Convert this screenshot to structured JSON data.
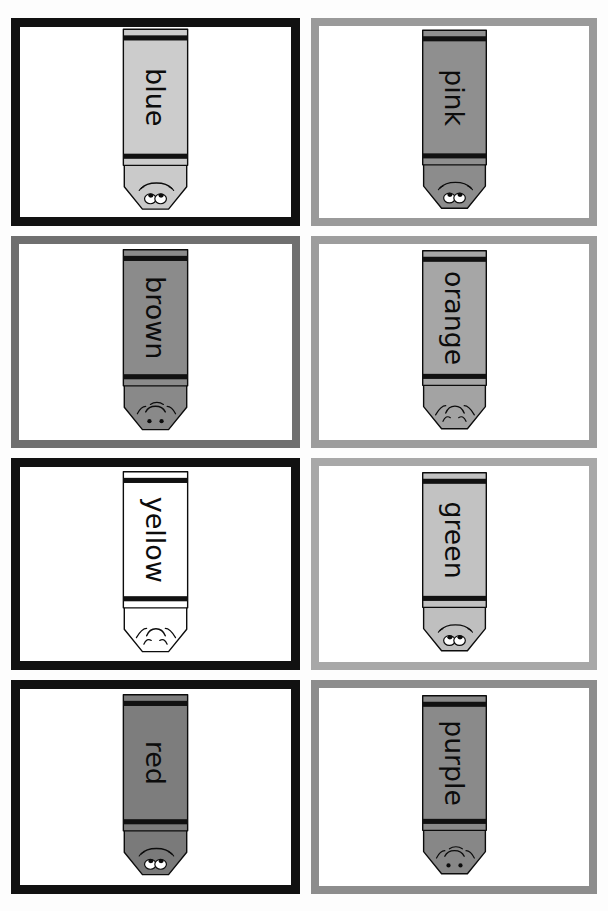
{
  "document": {
    "title": "Crayon Color Word Flashcards",
    "header_fragment_left": "y   g",
    "header_fragment_mid": "pp",
    "header_fragment_right": "g",
    "page_width": 608,
    "page_height": 911,
    "columns": 2,
    "rows": 4,
    "is_grayscale": true
  },
  "palette": {
    "ink_black": "#0c0c0c",
    "card_border": "#111111",
    "card_border_soft": "#8f8f8f",
    "card_face": "#ffffff",
    "page_bg": "#fdfdfd",
    "band_black": "#111111",
    "outline": "#0c0c0c"
  },
  "cards": [
    {
      "id": "card-blue",
      "label": "blue",
      "column": 1,
      "row": 1,
      "crayon_fill": "#cccccc",
      "crayon_tip_fill": "#cacaca",
      "border_color": "#111111",
      "border_style": "black",
      "face": "open-eyes",
      "x": 11,
      "y": 18,
      "w": 289,
      "h": 208
    },
    {
      "id": "card-pink",
      "label": "pink",
      "column": 2,
      "row": 1,
      "crayon_fill": "#8f8f8f",
      "crayon_tip_fill": "#8c8c8c",
      "border_color": "#9a9a9a",
      "border_style": "gray",
      "face": "open-eyes",
      "x": 311,
      "y": 18,
      "w": 286,
      "h": 208
    },
    {
      "id": "card-brown",
      "label": "brown",
      "column": 1,
      "row": 2,
      "crayon_fill": "#8b8b8b",
      "crayon_tip_fill": "#898989",
      "border_color": "#6f6f6f",
      "border_style": "gray",
      "face": "dot-eyes",
      "x": 11,
      "y": 236,
      "w": 289,
      "h": 212
    },
    {
      "id": "card-orange",
      "label": "orange",
      "column": 2,
      "row": 2,
      "crayon_fill": "#a6a6a6",
      "crayon_tip_fill": "#a3a3a3",
      "border_color": "#9d9d9d",
      "border_style": "gray",
      "face": "closed-eyes",
      "x": 311,
      "y": 236,
      "w": 286,
      "h": 212
    },
    {
      "id": "card-yellow",
      "label": "yellow",
      "column": 1,
      "row": 3,
      "crayon_fill": "#ffffff",
      "crayon_tip_fill": "#ffffff",
      "border_color": "#111111",
      "border_style": "black",
      "face": "closed-eyes",
      "x": 11,
      "y": 458,
      "w": 289,
      "h": 212
    },
    {
      "id": "card-green",
      "label": "green",
      "column": 2,
      "row": 3,
      "crayon_fill": "#c2c2c2",
      "crayon_tip_fill": "#bfbfbf",
      "border_color": "#a8a8a8",
      "border_style": "gray",
      "face": "open-eyes",
      "x": 311,
      "y": 458,
      "w": 286,
      "h": 212
    },
    {
      "id": "card-red",
      "label": "red",
      "column": 1,
      "row": 4,
      "crayon_fill": "#7d7d7d",
      "crayon_tip_fill": "#7a7a7a",
      "border_color": "#111111",
      "border_style": "black",
      "face": "open-eyes",
      "x": 11,
      "y": 680,
      "w": 289,
      "h": 214
    },
    {
      "id": "card-purple",
      "label": "purple",
      "column": 2,
      "row": 4,
      "crayon_fill": "#8a8a8a",
      "crayon_tip_fill": "#878787",
      "border_color": "#8d8d8d",
      "border_style": "gray",
      "face": "dot-eyes",
      "x": 311,
      "y": 680,
      "w": 286,
      "h": 214
    }
  ]
}
